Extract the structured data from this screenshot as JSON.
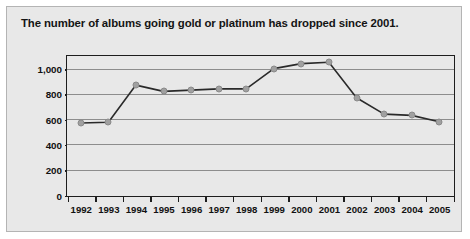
{
  "figure": {
    "title": "The number of albums going gold or platinum has dropped since 2001."
  },
  "chart_data": {
    "type": "line",
    "title": "The number of albums going gold or platinum has dropped since 2001.",
    "xlabel": "",
    "ylabel": "No. of albums certified gold or platinum",
    "categories": [
      "1992",
      "1993",
      "1994",
      "1995",
      "1996",
      "1997",
      "1998",
      "1999",
      "2000",
      "2001",
      "2002",
      "2003",
      "2004",
      "2005"
    ],
    "values": [
      570,
      575,
      870,
      820,
      830,
      840,
      840,
      1000,
      1040,
      1050,
      770,
      640,
      630,
      580
    ],
    "series": [
      {
        "name": "No. of albums certified gold or platinum",
        "values": [
          570,
          575,
          870,
          820,
          830,
          840,
          840,
          1000,
          1040,
          1050,
          770,
          640,
          630,
          580
        ]
      }
    ],
    "ylim": [
      0,
      1100
    ],
    "yticks": [
      0,
      200,
      400,
      600,
      800,
      1000
    ],
    "ytick_labels": [
      "0",
      "200",
      "400",
      "600",
      "800",
      "1,000"
    ],
    "grid": true,
    "legend": "none",
    "marker": "circle",
    "line_color": "#2a2a2a",
    "marker_color": "#a0a0a0",
    "grid_color": "#8d8d8d",
    "background_color": "#e8e8e8"
  }
}
